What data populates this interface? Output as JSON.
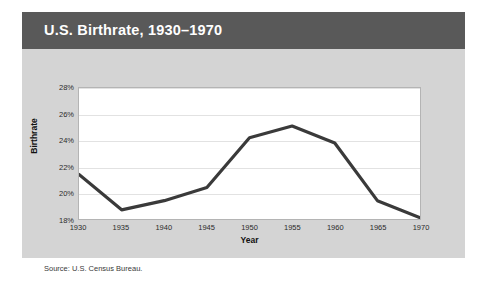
{
  "figure": {
    "title": "U.S. Birthrate, 1930–1970",
    "source_note": "Source: U.S. Census Bureau.",
    "header_color": "#595959",
    "body_color": "#d4d4d4",
    "plot_background": "#ffffff",
    "line_color": "#3a3a3a"
  },
  "chart_data": {
    "type": "line",
    "title": "U.S. Birthrate, 1930–1970",
    "xlabel": "Year",
    "ylabel": "Birthrate",
    "categories": [
      1930,
      1935,
      1940,
      1945,
      1950,
      1955,
      1960,
      1965,
      1970
    ],
    "x_tick_labels": [
      "1930",
      "1935",
      "1940",
      "1945",
      "1950",
      "1955",
      "1960",
      "1965",
      "1970"
    ],
    "values": [
      21.4,
      18.7,
      19.4,
      20.4,
      24.2,
      25.1,
      23.8,
      19.4,
      18.1
    ],
    "y_tick_labels": [
      "18%",
      "20%",
      "22%",
      "24%",
      "26%",
      "28%"
    ],
    "y_ticks": [
      18,
      20,
      22,
      24,
      26,
      28
    ],
    "ylim": [
      18,
      28
    ],
    "xlim": [
      1930,
      1970
    ],
    "grid": true,
    "legend": null,
    "series": [
      {
        "name": "Birthrate",
        "values": [
          21.4,
          18.7,
          19.4,
          20.4,
          24.2,
          25.1,
          23.8,
          19.4,
          18.1
        ]
      }
    ]
  }
}
